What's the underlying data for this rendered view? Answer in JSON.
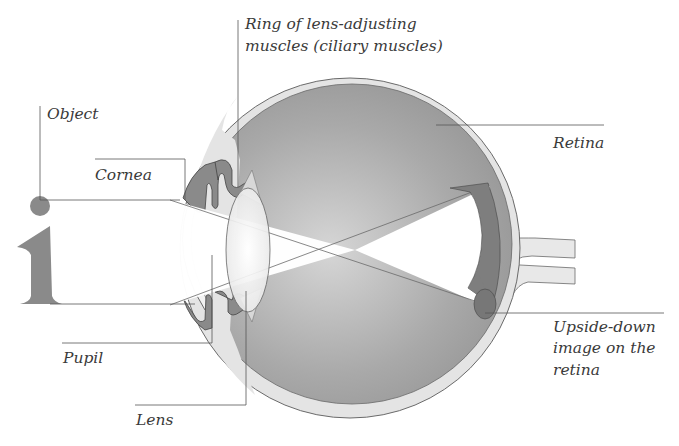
{
  "diagram": {
    "type": "eye-cross-section",
    "labels": {
      "ciliary_line1": "Ring of lens-adjusting",
      "ciliary_line2": "muscles (ciliary muscles)",
      "object": "Object",
      "cornea": "Cornea",
      "retina": "Retina",
      "pupil": "Pupil",
      "lens": "Lens",
      "image_line1": "Upside-down",
      "image_line2": "image on the",
      "image_line3": "retina"
    },
    "object_glyph": "i"
  },
  "colors": {
    "background": "#ffffff",
    "eye_interior": "#9a9a9a",
    "sclera": "#e4e4e4",
    "iris": "#8a8a8a",
    "leader_line": "#555555",
    "text": "#3a3a3a"
  }
}
